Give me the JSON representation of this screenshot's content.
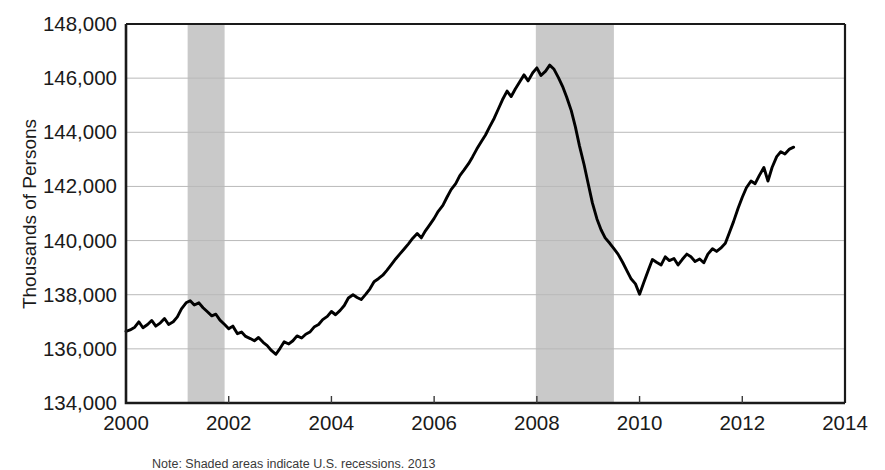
{
  "chart_data": {
    "type": "line",
    "title": "",
    "subtitle": "",
    "xlabel": "",
    "ylabel": "Thousands of Persons",
    "xlim": [
      2000,
      2014
    ],
    "ylim": [
      134000,
      148000
    ],
    "grid": true,
    "legend": null,
    "x_ticks": [
      "2000",
      "2002",
      "2004",
      "2006",
      "2008",
      "2010",
      "2012",
      "2014"
    ],
    "x_tick_values": [
      2000,
      2002,
      2004,
      2006,
      2008,
      2010,
      2012,
      2014
    ],
    "y_ticks": [
      "134,000",
      "136,000",
      "138,000",
      "140,000",
      "142,000",
      "144,000",
      "146,000",
      "148,000"
    ],
    "y_tick_values": [
      134000,
      136000,
      138000,
      140000,
      142000,
      144000,
      146000,
      148000
    ],
    "line_color": "#000000",
    "shading_color": "#c9c9c9",
    "shaded_regions": [
      {
        "label": "recession-2001",
        "start": 2001.2,
        "end": 2001.92
      },
      {
        "label": "recession-2008",
        "start": 2007.98,
        "end": 2009.5
      }
    ],
    "note": "Note: Shaded areas indicate U.S. recessions. 2013",
    "series": [
      {
        "name": "Employment Level",
        "x": [
          2000.0,
          2000.08,
          2000.17,
          2000.25,
          2000.33,
          2000.42,
          2000.5,
          2000.58,
          2000.67,
          2000.75,
          2000.83,
          2000.92,
          2001.0,
          2001.08,
          2001.17,
          2001.25,
          2001.33,
          2001.42,
          2001.5,
          2001.58,
          2001.67,
          2001.75,
          2001.83,
          2001.92,
          2002.0,
          2002.08,
          2002.17,
          2002.25,
          2002.33,
          2002.42,
          2002.5,
          2002.58,
          2002.67,
          2002.75,
          2002.83,
          2002.92,
          2003.0,
          2003.08,
          2003.17,
          2003.25,
          2003.33,
          2003.42,
          2003.5,
          2003.58,
          2003.67,
          2003.75,
          2003.83,
          2003.92,
          2004.0,
          2004.08,
          2004.17,
          2004.25,
          2004.33,
          2004.42,
          2004.5,
          2004.58,
          2004.67,
          2004.75,
          2004.83,
          2004.92,
          2005.0,
          2005.08,
          2005.17,
          2005.25,
          2005.33,
          2005.42,
          2005.5,
          2005.58,
          2005.67,
          2005.75,
          2005.83,
          2005.92,
          2006.0,
          2006.08,
          2006.17,
          2006.25,
          2006.33,
          2006.42,
          2006.5,
          2006.58,
          2006.67,
          2006.75,
          2006.83,
          2006.92,
          2007.0,
          2007.08,
          2007.17,
          2007.25,
          2007.33,
          2007.42,
          2007.5,
          2007.58,
          2007.67,
          2007.75,
          2007.83,
          2007.92,
          2008.0,
          2008.08,
          2008.17,
          2008.25,
          2008.33,
          2008.42,
          2008.5,
          2008.58,
          2008.67,
          2008.75,
          2008.83,
          2008.92,
          2009.0,
          2009.08,
          2009.17,
          2009.25,
          2009.33,
          2009.42,
          2009.5,
          2009.58,
          2009.67,
          2009.75,
          2009.83,
          2009.92,
          2010.0,
          2010.08,
          2010.17,
          2010.25,
          2010.33,
          2010.42,
          2010.5,
          2010.58,
          2010.67,
          2010.75,
          2010.83,
          2010.92,
          2011.0,
          2011.08,
          2011.17,
          2011.25,
          2011.33,
          2011.42,
          2011.5,
          2011.58,
          2011.67,
          2011.75,
          2011.83,
          2011.92,
          2012.0,
          2012.08,
          2012.17,
          2012.25,
          2012.33,
          2012.42,
          2012.5,
          2012.58,
          2012.67,
          2012.75,
          2012.83,
          2012.92,
          2013.0
        ],
        "y": [
          136650,
          136700,
          136800,
          137000,
          136780,
          136900,
          137050,
          136840,
          136960,
          137120,
          136900,
          137000,
          137180,
          137480,
          137700,
          137780,
          137620,
          137700,
          137520,
          137380,
          137220,
          137280,
          137060,
          136900,
          136740,
          136840,
          136560,
          136620,
          136460,
          136380,
          136300,
          136420,
          136240,
          136120,
          135940,
          135800,
          136020,
          136260,
          136180,
          136300,
          136480,
          136400,
          136540,
          136620,
          136820,
          136900,
          137080,
          137200,
          137380,
          137260,
          137420,
          137600,
          137880,
          138000,
          137900,
          137820,
          138020,
          138220,
          138480,
          138600,
          138720,
          138900,
          139120,
          139320,
          139500,
          139700,
          139880,
          140080,
          140260,
          140100,
          140360,
          140600,
          140820,
          141080,
          141300,
          141600,
          141880,
          142100,
          142400,
          142600,
          142840,
          143100,
          143380,
          143660,
          143900,
          144200,
          144520,
          144860,
          145200,
          145520,
          145320,
          145600,
          145880,
          146120,
          145900,
          146200,
          146380,
          146100,
          146260,
          146480,
          146340,
          146020,
          145700,
          145300,
          144800,
          144200,
          143500,
          142800,
          142100,
          141400,
          140800,
          140400,
          140100,
          139900,
          139700,
          139500,
          139200,
          138900,
          138600,
          138400,
          138020,
          138440,
          138900,
          139300,
          139200,
          139100,
          139400,
          139260,
          139340,
          139100,
          139300,
          139500,
          139400,
          139230,
          139320,
          139180,
          139500,
          139700,
          139600,
          139720,
          139900,
          140300,
          140700,
          141200,
          141600,
          141950,
          142200,
          142100,
          142400,
          142700,
          142200,
          142700,
          143100,
          143280,
          143200,
          143380,
          143450
        ]
      }
    ]
  },
  "axis": {
    "y_axis_title": "Thousands of Persons"
  }
}
